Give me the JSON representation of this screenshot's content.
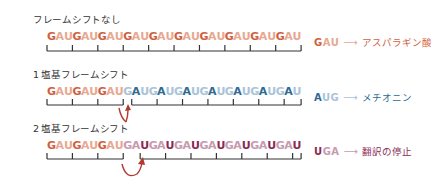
{
  "rows": [
    {
      "title": "フレームシフトなし",
      "sequence": "GAUGAUGAUGAUGAUGAUGAUGAUGAUGAU",
      "legend": {
        "codon": "GAU",
        "arrow": "→",
        "meaning": "アスパラギン酸",
        "color": "#d0603d"
      }
    },
    {
      "title": "1 塩基フレームシフト",
      "sequence": "GAUGAUGAUGAUGAUGAUGAUGAUGAUGAU",
      "legend": {
        "codon": "AUG",
        "arrow": "→",
        "meaning": "メチオニン",
        "color": "#2e6a95"
      }
    },
    {
      "title": "2 塩基フレームシフト",
      "sequence": "GAUGAUGAUGAUGAUGAUGAUGAUGAUGAU",
      "legend": {
        "codon": "UGA",
        "arrow": "→",
        "meaning": "翻訳の停止",
        "color": "#8a2a55"
      }
    }
  ],
  "colors": {
    "gau_strong": "#d0603d",
    "gau_weak": "#e8a890",
    "aug_strong": "#2e6a95",
    "aug_weak": "#a9c3d8",
    "uga_strong": "#8a2a55",
    "uga_weak": "#c79ab0",
    "shift_arrow": "#b03a2e",
    "bracket": "#333333"
  }
}
